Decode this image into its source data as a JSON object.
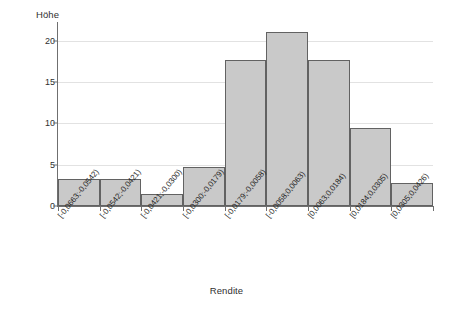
{
  "chart_data": {
    "type": "bar",
    "title": "",
    "subtitle": "",
    "xlabel": "Rendite",
    "ylabel": "Höhe",
    "grid": true,
    "legend": false,
    "legend_position": "none",
    "ylim": [
      0,
      22
    ],
    "yticks": [
      0,
      5,
      10,
      15,
      20
    ],
    "ytick_labels": [
      "0",
      "5",
      "10",
      "15",
      "20"
    ],
    "categories": [
      "[-0,0663;-0,0542)",
      "[-0,0542;-0,0421)",
      "[-0,0421;-0,0300)",
      "[-0,0300;-0,0179)",
      "[-0,0179;-0,0058)",
      "[-0,0058;0,0063)",
      "[0,0063;0,0184)",
      "[0,0184;0,0305)",
      "[0,0305;0,0426)"
    ],
    "values": [
      3.3,
      3.3,
      1.5,
      4.7,
      17.7,
      21.0,
      17.6,
      9.4,
      2.8
    ],
    "bar_fill_color": "#c9c9c9",
    "bar_border_color": "#626262",
    "grid_color": "#e2e2e2",
    "axis_color": "#6f6f6f",
    "background_color": "#ffffff"
  }
}
